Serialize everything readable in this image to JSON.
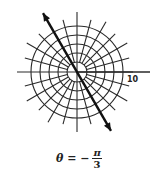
{
  "diagram": {
    "type": "polar-grid",
    "center": [
      77,
      72
    ],
    "ring_radii_px": [
      10,
      19,
      28,
      37,
      46,
      55
    ],
    "radial_step_deg": 15,
    "axis_label": "10",
    "line": {
      "angle": "-π/3",
      "arrows": "both"
    }
  },
  "caption": {
    "lhs": "θ = −",
    "numerator": "π",
    "denominator": "3"
  }
}
